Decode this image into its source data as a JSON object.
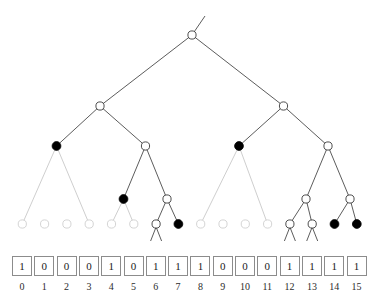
{
  "diagram": {
    "colors": {
      "filled_node": "#000000",
      "open_node_stroke": "#3a3a3a",
      "faint_node_stroke": "#cfcfcf",
      "edge_dark": "#4a4a4a",
      "edge_light": "#c8c8c8",
      "box_border": "#8c8c8c",
      "text": "#1a1a1a",
      "background": "#ffffff"
    },
    "geometry": {
      "leaf_x0": 22.3,
      "leaf_pitch": 22.3,
      "level_y": [
        35,
        106,
        146,
        199,
        224
      ]
    }
  },
  "tree": {
    "nodes": [
      {
        "id": "root",
        "x": 192,
        "y": 35,
        "level": 1,
        "style": "open"
      },
      {
        "id": "L2a",
        "x": 100,
        "y": 106,
        "level": 2,
        "style": "open"
      },
      {
        "id": "L2b",
        "x": 283.5,
        "y": 106,
        "level": 2,
        "style": "open"
      },
      {
        "id": "L3a",
        "x": 56.5,
        "y": 146,
        "level": 3,
        "style": "filled"
      },
      {
        "id": "L3b",
        "x": 145.5,
        "y": 146,
        "level": 3,
        "style": "open"
      },
      {
        "id": "L3c",
        "x": 239,
        "y": 146,
        "level": 3,
        "style": "filled"
      },
      {
        "id": "L3d",
        "x": 328,
        "y": 146,
        "level": 3,
        "style": "open"
      },
      {
        "id": "L4a",
        "x": 123.5,
        "y": 199,
        "level": 4,
        "style": "filled"
      },
      {
        "id": "L4b",
        "x": 167,
        "y": 199,
        "level": 4,
        "style": "open"
      },
      {
        "id": "L4c",
        "x": 306,
        "y": 199,
        "level": 4,
        "style": "open"
      },
      {
        "id": "L4d",
        "x": 350,
        "y": 199,
        "level": 4,
        "style": "open"
      }
    ],
    "leaves": [
      {
        "index": 0,
        "x": 22.3,
        "y": 224,
        "style": "faint",
        "legs": false
      },
      {
        "index": 1,
        "x": 44.6,
        "y": 224,
        "style": "faint",
        "legs": false
      },
      {
        "index": 2,
        "x": 66.9,
        "y": 224,
        "style": "faint",
        "legs": false
      },
      {
        "index": 3,
        "x": 89.2,
        "y": 224,
        "style": "faint",
        "legs": false
      },
      {
        "index": 4,
        "x": 111.5,
        "y": 224,
        "style": "faint",
        "legs": false
      },
      {
        "index": 5,
        "x": 133.8,
        "y": 224,
        "style": "faint",
        "legs": false
      },
      {
        "index": 6,
        "x": 156.1,
        "y": 224,
        "style": "open",
        "legs": true
      },
      {
        "index": 7,
        "x": 178.4,
        "y": 224,
        "style": "filled",
        "legs": false
      },
      {
        "index": 8,
        "x": 200.7,
        "y": 224,
        "style": "faint",
        "legs": false
      },
      {
        "index": 9,
        "x": 223.0,
        "y": 224,
        "style": "faint",
        "legs": false
      },
      {
        "index": 10,
        "x": 245.3,
        "y": 224,
        "style": "faint",
        "legs": false
      },
      {
        "index": 11,
        "x": 267.6,
        "y": 224,
        "style": "faint",
        "legs": false
      },
      {
        "index": 12,
        "x": 289.9,
        "y": 224,
        "style": "open",
        "legs": true
      },
      {
        "index": 13,
        "x": 312.2,
        "y": 224,
        "style": "open",
        "legs": true
      },
      {
        "index": 14,
        "x": 334.5,
        "y": 224,
        "style": "filled",
        "legs": false
      },
      {
        "index": 15,
        "x": 356.8,
        "y": 224,
        "style": "filled",
        "legs": false
      }
    ],
    "edges": [
      {
        "from": "stub",
        "x1": 192,
        "y1": 35,
        "x2": 205,
        "y2": 16,
        "tone": "dark"
      },
      {
        "from": "root-L2a",
        "x1": 192,
        "y1": 35,
        "x2": 100,
        "y2": 106,
        "tone": "dark"
      },
      {
        "from": "root-L2b",
        "x1": 192,
        "y1": 35,
        "x2": 283.5,
        "y2": 106,
        "tone": "dark"
      },
      {
        "from": "L2a-L3a",
        "x1": 100,
        "y1": 106,
        "x2": 56.5,
        "y2": 146,
        "tone": "dark"
      },
      {
        "from": "L2a-L3b",
        "x1": 100,
        "y1": 106,
        "x2": 145.5,
        "y2": 146,
        "tone": "dark"
      },
      {
        "from": "L2b-L3c",
        "x1": 283.5,
        "y1": 106,
        "x2": 239,
        "y2": 146,
        "tone": "dark"
      },
      {
        "from": "L2b-L3d",
        "x1": 283.5,
        "y1": 106,
        "x2": 328,
        "y2": 146,
        "tone": "dark"
      },
      {
        "from": "L3a-leaf0",
        "x1": 56.5,
        "y1": 146,
        "x2": 22.3,
        "y2": 224,
        "tone": "light"
      },
      {
        "from": "L3a-leaf3",
        "x1": 56.5,
        "y1": 146,
        "x2": 89.2,
        "y2": 224,
        "tone": "light"
      },
      {
        "from": "L3b-L4a",
        "x1": 145.5,
        "y1": 146,
        "x2": 123.5,
        "y2": 199,
        "tone": "dark"
      },
      {
        "from": "L3b-L4b",
        "x1": 145.5,
        "y1": 146,
        "x2": 167,
        "y2": 199,
        "tone": "dark"
      },
      {
        "from": "L4a-leaf4",
        "x1": 123.5,
        "y1": 199,
        "x2": 111.5,
        "y2": 224,
        "tone": "light"
      },
      {
        "from": "L4a-leaf5",
        "x1": 123.5,
        "y1": 199,
        "x2": 133.8,
        "y2": 224,
        "tone": "light"
      },
      {
        "from": "L4b-leaf6",
        "x1": 167,
        "y1": 199,
        "x2": 156.1,
        "y2": 224,
        "tone": "dark"
      },
      {
        "from": "L4b-leaf7",
        "x1": 167,
        "y1": 199,
        "x2": 178.4,
        "y2": 224,
        "tone": "dark"
      },
      {
        "from": "L3c-leaf8",
        "x1": 239,
        "y1": 146,
        "x2": 200.7,
        "y2": 224,
        "tone": "light"
      },
      {
        "from": "L3c-leaf11",
        "x1": 239,
        "y1": 146,
        "x2": 267.6,
        "y2": 224,
        "tone": "light"
      },
      {
        "from": "L3d-L4c",
        "x1": 328,
        "y1": 146,
        "x2": 306,
        "y2": 199,
        "tone": "dark"
      },
      {
        "from": "L3d-L4d",
        "x1": 328,
        "y1": 146,
        "x2": 350,
        "y2": 199,
        "tone": "dark"
      },
      {
        "from": "L4c-leaf12",
        "x1": 306,
        "y1": 199,
        "x2": 289.9,
        "y2": 224,
        "tone": "dark"
      },
      {
        "from": "L4c-leaf13",
        "x1": 306,
        "y1": 199,
        "x2": 312.2,
        "y2": 224,
        "tone": "dark"
      },
      {
        "from": "L4d-leaf14",
        "x1": 350,
        "y1": 199,
        "x2": 334.5,
        "y2": 224,
        "tone": "dark"
      },
      {
        "from": "L4d-leaf15",
        "x1": 350,
        "y1": 199,
        "x2": 356.8,
        "y2": 224,
        "tone": "dark"
      }
    ]
  },
  "bitvector": {
    "bits": [
      "1",
      "0",
      "0",
      "0",
      "1",
      "0",
      "1",
      "1",
      "1",
      "0",
      "0",
      "0",
      "1",
      "1",
      "1",
      "1"
    ],
    "indices": [
      "0",
      "1",
      "2",
      "3",
      "4",
      "5",
      "6",
      "7",
      "8",
      "9",
      "10",
      "11",
      "12",
      "13",
      "14",
      "15"
    ]
  }
}
